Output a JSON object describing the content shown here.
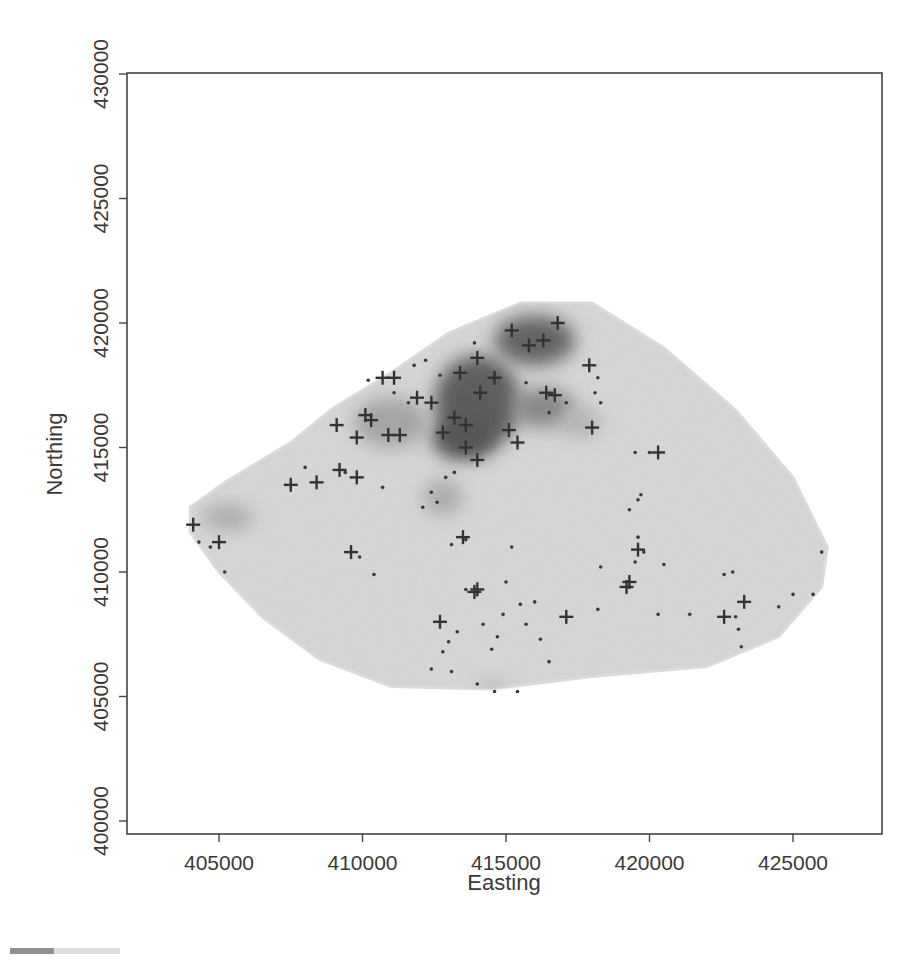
{
  "chart_data": {
    "type": "heatmap",
    "title": "",
    "xlabel": "Easting",
    "ylabel": "Northing",
    "xlim": [
      402000,
      428000
    ],
    "ylim": [
      399800,
      430600
    ],
    "x_ticks": [
      405000,
      410000,
      415000,
      420000,
      425000
    ],
    "y_ticks": [
      400000,
      405000,
      410000,
      415000,
      420000,
      425000,
      430000
    ],
    "x_tick_labels": [
      "405000",
      "410000",
      "415000",
      "420000",
      "425000"
    ],
    "y_tick_labels": [
      "400000",
      "405000",
      "410000",
      "415000",
      "420000",
      "425000",
      "430000"
    ],
    "grid": false,
    "legend": null,
    "region_outline": [
      [
        404000,
        412600
      ],
      [
        405200,
        413600
      ],
      [
        407500,
        415200
      ],
      [
        409000,
        416600
      ],
      [
        411000,
        418000
      ],
      [
        413000,
        419600
      ],
      [
        415500,
        420800
      ],
      [
        418000,
        420800
      ],
      [
        420500,
        419000
      ],
      [
        423000,
        416500
      ],
      [
        425000,
        413800
      ],
      [
        426200,
        411000
      ],
      [
        426000,
        409400
      ],
      [
        424500,
        407400
      ],
      [
        422000,
        406200
      ],
      [
        418000,
        405800
      ],
      [
        414500,
        405300
      ],
      [
        411000,
        405400
      ],
      [
        408500,
        406500
      ],
      [
        406500,
        408200
      ],
      [
        405000,
        410000
      ],
      [
        404000,
        411600
      ]
    ],
    "density_hotspots": [
      {
        "x": 414000,
        "y": 416800,
        "rx": 1500,
        "ry": 1900,
        "intensity": 0.85
      },
      {
        "x": 416000,
        "y": 419300,
        "rx": 1400,
        "ry": 1000,
        "intensity": 0.8
      },
      {
        "x": 413500,
        "y": 415400,
        "rx": 1100,
        "ry": 900,
        "intensity": 0.9
      },
      {
        "x": 416300,
        "y": 416600,
        "rx": 1100,
        "ry": 800,
        "intensity": 0.55
      },
      {
        "x": 411000,
        "y": 416000,
        "rx": 1300,
        "ry": 1000,
        "intensity": 0.35
      },
      {
        "x": 405300,
        "y": 412200,
        "rx": 900,
        "ry": 500,
        "intensity": 0.3
      },
      {
        "x": 412800,
        "y": 413000,
        "rx": 700,
        "ry": 700,
        "intensity": 0.3
      },
      {
        "x": 417600,
        "y": 416000,
        "rx": 700,
        "ry": 600,
        "intensity": 0.25
      },
      {
        "x": 414500,
        "y": 405400,
        "rx": 500,
        "ry": 300,
        "intensity": 0.2
      }
    ],
    "series": [
      {
        "name": "cases",
        "marker": "+",
        "points": [
          [
            404100,
            411900
          ],
          [
            405000,
            411200
          ],
          [
            407500,
            413500
          ],
          [
            408400,
            413600
          ],
          [
            409100,
            415900
          ],
          [
            409200,
            414100
          ],
          [
            409800,
            415400
          ],
          [
            409800,
            413800
          ],
          [
            409600,
            410800
          ],
          [
            410100,
            416300
          ],
          [
            410300,
            416100
          ],
          [
            410700,
            417800
          ],
          [
            411100,
            417800
          ],
          [
            410900,
            415500
          ],
          [
            411300,
            415500
          ],
          [
            411900,
            417000
          ],
          [
            412400,
            416800
          ],
          [
            412800,
            415600
          ],
          [
            413200,
            416200
          ],
          [
            413400,
            418000
          ],
          [
            413600,
            415900
          ],
          [
            414000,
            418600
          ],
          [
            414100,
            417200
          ],
          [
            413600,
            415000
          ],
          [
            414000,
            414500
          ],
          [
            414600,
            417800
          ],
          [
            415100,
            415700
          ],
          [
            415400,
            415200
          ],
          [
            415800,
            419100
          ],
          [
            416300,
            419300
          ],
          [
            416400,
            417200
          ],
          [
            416700,
            417100
          ],
          [
            417900,
            418300
          ],
          [
            418000,
            415800
          ],
          [
            420300,
            414800
          ],
          [
            413500,
            411400
          ],
          [
            412700,
            408000
          ],
          [
            413900,
            409200
          ],
          [
            414000,
            409300
          ],
          [
            417100,
            408200
          ],
          [
            419200,
            409400
          ],
          [
            419300,
            409600
          ],
          [
            419600,
            410900
          ],
          [
            422600,
            408200
          ],
          [
            423300,
            408800
          ],
          [
            416800,
            420000
          ],
          [
            415200,
            419700
          ]
        ]
      },
      {
        "name": "controls",
        "marker": "dot",
        "points": [
          [
            404300,
            411200
          ],
          [
            405200,
            410000
          ],
          [
            404700,
            411000
          ],
          [
            409900,
            410600
          ],
          [
            410400,
            409900
          ],
          [
            408000,
            414200
          ],
          [
            409400,
            414000
          ],
          [
            410700,
            413400
          ],
          [
            411100,
            417200
          ],
          [
            410200,
            417700
          ],
          [
            412200,
            418500
          ],
          [
            411600,
            416800
          ],
          [
            412100,
            412600
          ],
          [
            412600,
            412800
          ],
          [
            412400,
            413200
          ],
          [
            412900,
            413800
          ],
          [
            413200,
            414000
          ],
          [
            413100,
            411100
          ],
          [
            413600,
            411300
          ],
          [
            413600,
            409300
          ],
          [
            413000,
            407200
          ],
          [
            412800,
            406800
          ],
          [
            413300,
            407600
          ],
          [
            414200,
            407900
          ],
          [
            414500,
            406900
          ],
          [
            414700,
            407400
          ],
          [
            414900,
            408300
          ],
          [
            415000,
            409600
          ],
          [
            415500,
            408700
          ],
          [
            415700,
            407900
          ],
          [
            416200,
            407300
          ],
          [
            416500,
            406400
          ],
          [
            414600,
            405200
          ],
          [
            415400,
            405200
          ],
          [
            413100,
            406000
          ],
          [
            412400,
            406100
          ],
          [
            414000,
            405500
          ],
          [
            415200,
            411000
          ],
          [
            416000,
            408800
          ],
          [
            418200,
            408500
          ],
          [
            418300,
            410200
          ],
          [
            419500,
            410400
          ],
          [
            419800,
            410800
          ],
          [
            419600,
            411400
          ],
          [
            419300,
            412500
          ],
          [
            419600,
            412900
          ],
          [
            419700,
            413100
          ],
          [
            420000,
            414800
          ],
          [
            419500,
            414800
          ],
          [
            418100,
            417200
          ],
          [
            418200,
            417800
          ],
          [
            418300,
            416800
          ],
          [
            420300,
            408300
          ],
          [
            421400,
            408300
          ],
          [
            422600,
            409900
          ],
          [
            422900,
            410000
          ],
          [
            423100,
            407700
          ],
          [
            423000,
            408200
          ],
          [
            424500,
            408600
          ],
          [
            425000,
            409100
          ],
          [
            425700,
            409100
          ],
          [
            426000,
            410800
          ],
          [
            423200,
            407000
          ],
          [
            420500,
            410300
          ],
          [
            415700,
            417600
          ],
          [
            416500,
            416400
          ],
          [
            417100,
            416800
          ],
          [
            413900,
            419200
          ],
          [
            412700,
            417900
          ],
          [
            411800,
            418300
          ]
        ]
      }
    ]
  },
  "figure": {
    "x_axis_title": "Easting",
    "y_axis_title": "Northing"
  }
}
